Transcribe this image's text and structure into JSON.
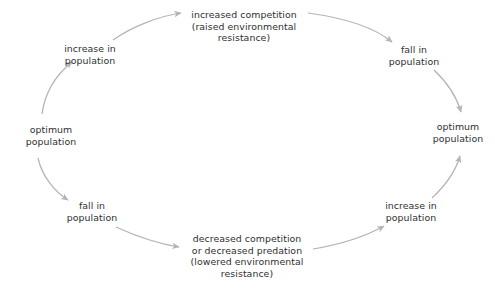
{
  "diagram": {
    "type": "population-regulation-cycle",
    "direction": "clockwise",
    "background_color": "#ffffff",
    "text_color": "#2f2f2f",
    "arrow_color": "#b4b4b4",
    "nodes": [
      {
        "id": "optimum-population-left",
        "label": "optimum\npopulation",
        "x": 51,
        "y": 136
      },
      {
        "id": "increase-in-population-top-left",
        "label": "increase in\npopulation",
        "x": 90,
        "y": 55
      },
      {
        "id": "increased-competition-top",
        "label": "increased competition\n(raised environmental\nresistance)",
        "x": 244,
        "y": 26
      },
      {
        "id": "fall-in-population-top-right",
        "label": "fall in\npopulation",
        "x": 414,
        "y": 56
      },
      {
        "id": "optimum-population-right",
        "label": "optimum\npopulation",
        "x": 458,
        "y": 133
      },
      {
        "id": "increase-in-population-bottom-right",
        "label": "increase in\npopulation",
        "x": 411,
        "y": 212
      },
      {
        "id": "decreased-competition-bottom",
        "label": "decreased competition\nor decreased predation\n(lowered environmental\nresistance)",
        "x": 247,
        "y": 256
      },
      {
        "id": "fall-in-population-bottom-left",
        "label": "fall in\npopulation",
        "x": 92,
        "y": 212
      }
    ],
    "arrows": [
      {
        "id": "arrow-optimum-left-to-increase",
        "from": "optimum-population-left",
        "to": "increase-in-population-top-left"
      },
      {
        "id": "arrow-increase-to-increased-competition",
        "from": "increase-in-population-top-left",
        "to": "increased-competition-top"
      },
      {
        "id": "arrow-increased-competition-to-fall",
        "from": "increased-competition-top",
        "to": "fall-in-population-top-right"
      },
      {
        "id": "arrow-fall-to-optimum-right",
        "from": "fall-in-population-top-right",
        "to": "optimum-population-right"
      },
      {
        "id": "arrow-increase-bottom-to-optimum-right",
        "from": "increase-in-population-bottom-right",
        "to": "optimum-population-right"
      },
      {
        "id": "arrow-decreased-competition-to-increase-bottom",
        "from": "decreased-competition-bottom",
        "to": "increase-in-population-bottom-right"
      },
      {
        "id": "arrow-fall-bottom-to-decreased-competition",
        "from": "fall-in-population-bottom-left",
        "to": "decreased-competition-bottom"
      },
      {
        "id": "arrow-optimum-left-to-fall-bottom",
        "from": "optimum-population-left",
        "to": "fall-in-population-bottom-left"
      }
    ]
  }
}
